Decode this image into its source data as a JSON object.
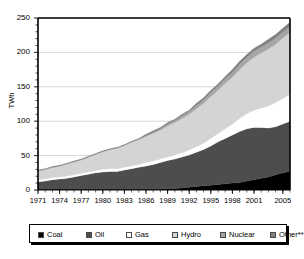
{
  "chart_data": {
    "type": "area",
    "stacked": true,
    "title": "",
    "subtitle": "",
    "xlabel": "",
    "ylabel": "TWh",
    "ylim": [
      0,
      250
    ],
    "yticks": [
      0,
      50,
      100,
      150,
      200,
      250
    ],
    "xlim": [
      1971,
      2006
    ],
    "xtick_labels": [
      "1971",
      "1974",
      "1977",
      "1980",
      "1983",
      "1986",
      "1989",
      "1992",
      "1995",
      "1998",
      "2001",
      "2005"
    ],
    "xtick_values": [
      1971,
      1974,
      1977,
      1980,
      1983,
      1986,
      1989,
      1992,
      1995,
      1998,
      2001,
      2005
    ],
    "grid": "horizontal",
    "legend_position": "bottom",
    "x": [
      1971,
      1972,
      1973,
      1974,
      1975,
      1976,
      1977,
      1978,
      1979,
      1980,
      1981,
      1982,
      1983,
      1984,
      1985,
      1986,
      1987,
      1988,
      1989,
      1990,
      1991,
      1992,
      1993,
      1994,
      1995,
      1996,
      1997,
      1998,
      1999,
      2000,
      2001,
      2002,
      2003,
      2004,
      2005,
      2006
    ],
    "series": [
      {
        "name": "Coal",
        "color": "#000000",
        "values": [
          1,
          1,
          1,
          1,
          1,
          1,
          1,
          1,
          1,
          1,
          1,
          1,
          1,
          1,
          1,
          1,
          1,
          1,
          2,
          2,
          3,
          4,
          5,
          6,
          7,
          8,
          9,
          10,
          11,
          13,
          15,
          17,
          19,
          22,
          25,
          27
        ]
      },
      {
        "name": "Oil",
        "color": "#4d4d4d",
        "values": [
          11,
          12,
          14,
          15,
          16,
          18,
          20,
          22,
          24,
          25,
          26,
          26,
          28,
          30,
          32,
          34,
          36,
          39,
          41,
          43,
          45,
          47,
          50,
          53,
          57,
          62,
          66,
          70,
          74,
          76,
          76,
          74,
          71,
          70,
          71,
          73
        ]
      },
      {
        "name": "Gas",
        "color": "#ffffff",
        "values": [
          3,
          3,
          3,
          3,
          3,
          3,
          3,
          3,
          3,
          4,
          4,
          4,
          4,
          4,
          4,
          5,
          5,
          5,
          5,
          6,
          6,
          7,
          8,
          9,
          11,
          12,
          14,
          16,
          19,
          22,
          25,
          28,
          32,
          35,
          37,
          39
        ]
      },
      {
        "name": "Hydro",
        "color": "#d4d4d4",
        "values": [
          13,
          14,
          15,
          16,
          18,
          19,
          20,
          22,
          24,
          26,
          28,
          30,
          32,
          34,
          36,
          38,
          40,
          42,
          45,
          47,
          50,
          52,
          55,
          58,
          61,
          63,
          66,
          68,
          71,
          74,
          77,
          80,
          83,
          85,
          88,
          90
        ]
      },
      {
        "name": "Nuclear",
        "color": "#a6a6a6",
        "values": [
          0,
          0,
          0,
          0,
          0,
          0,
          0,
          0,
          0,
          0,
          0,
          0,
          0,
          1,
          1,
          1,
          2,
          2,
          3,
          3,
          4,
          4,
          5,
          5,
          6,
          6,
          7,
          7,
          8,
          8,
          9,
          9,
          9,
          9,
          9,
          9
        ]
      },
      {
        "name": "Other**",
        "color": "#808080",
        "values": [
          1,
          1,
          1,
          1,
          1,
          1,
          1,
          1,
          1,
          1,
          1,
          1,
          1,
          1,
          1,
          2,
          2,
          2,
          2,
          2,
          2,
          2,
          3,
          3,
          3,
          3,
          3,
          4,
          4,
          4,
          4,
          4,
          5,
          5,
          5,
          6
        ]
      }
    ]
  },
  "legend": {
    "items": [
      {
        "label": "Coal",
        "color": "#000000"
      },
      {
        "label": "Oil",
        "color": "#4d4d4d"
      },
      {
        "label": "Gas",
        "color": "#ffffff"
      },
      {
        "label": "Hydro",
        "color": "#d4d4d4"
      },
      {
        "label": "Nuclear",
        "color": "#a6a6a6"
      },
      {
        "label": "Other**",
        "color": "#808080"
      }
    ]
  },
  "axes": {
    "y_label": "TWh",
    "y_tick_labels": [
      "0",
      "50",
      "100",
      "150",
      "200",
      "250"
    ]
  }
}
